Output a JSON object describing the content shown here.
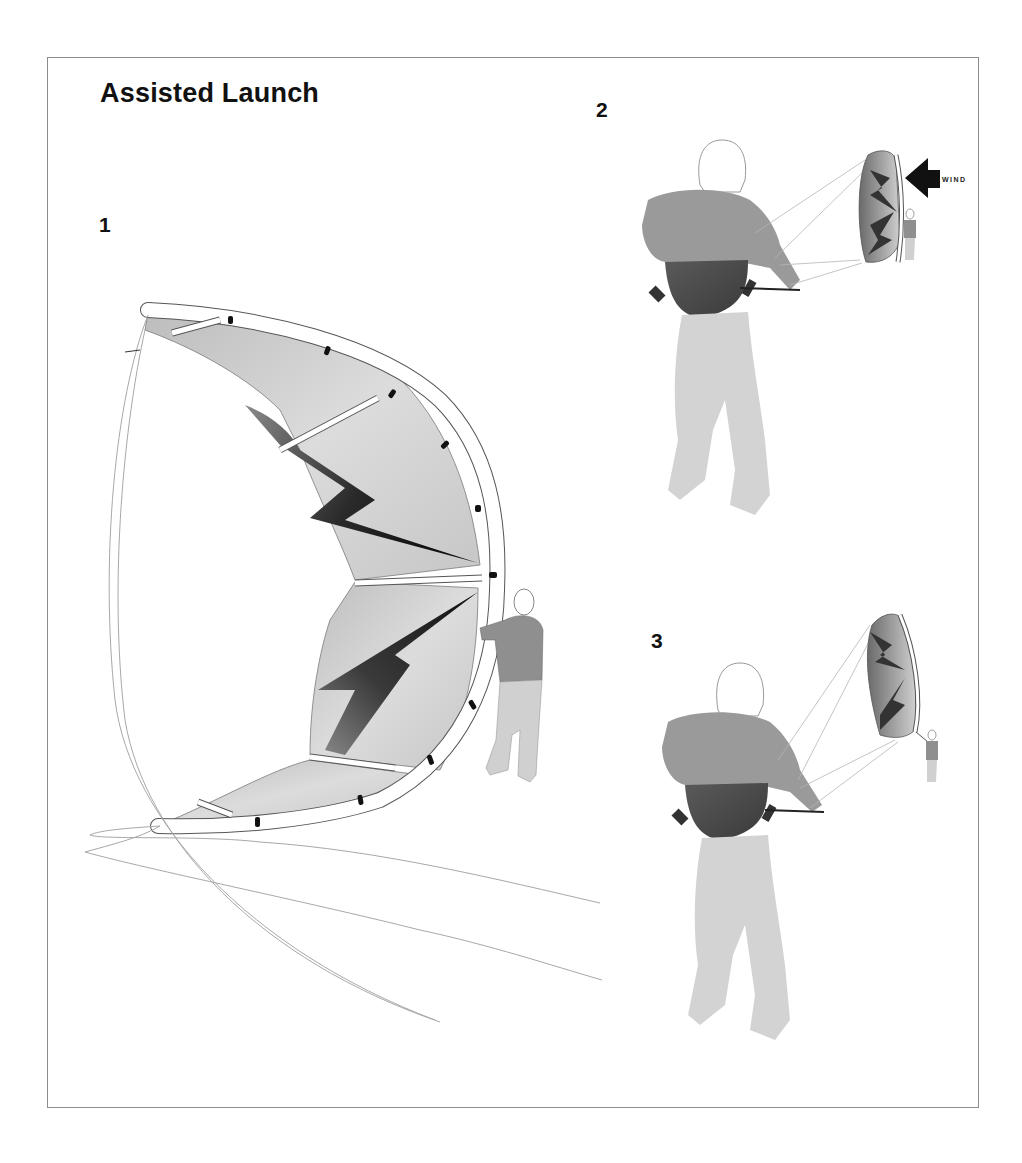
{
  "title": "Assisted Launch",
  "steps": [
    {
      "number": "1",
      "description_visual": "Assistant holds the kite upright on its leading edge while lines lie on the ground"
    },
    {
      "number": "2",
      "description_visual": "Rider holds control bar; kite held upright by assistant downwind, wind arrow pointing at kite"
    },
    {
      "number": "3",
      "description_visual": "Assistant releases the kite and it rises into the air"
    }
  ],
  "wind": {
    "label": "WIND",
    "icon": "arrow-left-icon"
  },
  "colors": {
    "frame_border": "#8c8c8c",
    "title_text": "#111111",
    "canopy_light": "#d4d4d4",
    "canopy_dark": "#2a2a2a",
    "sweater": "#9a9a9a",
    "harness": "#4a4a4a",
    "pants": "#d0d0d0",
    "lines": "#a8a8a8"
  }
}
